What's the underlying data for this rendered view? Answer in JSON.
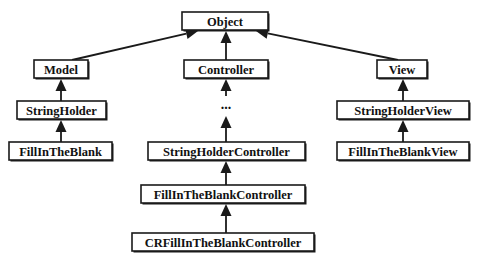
{
  "diagram": {
    "type": "class-inheritance-hierarchy",
    "nodes": [
      {
        "id": "object",
        "label": "Object"
      },
      {
        "id": "model",
        "label": "Model"
      },
      {
        "id": "controller",
        "label": "Controller"
      },
      {
        "id": "view",
        "label": "View"
      },
      {
        "id": "stringholder",
        "label": "StringHolder"
      },
      {
        "id": "fillintheblank",
        "label": "FillInTheBlank"
      },
      {
        "id": "ellipsis",
        "label": "..."
      },
      {
        "id": "stringholdercontroller",
        "label": "StringHolderController"
      },
      {
        "id": "fillintheblankcontroller",
        "label": "FillInTheBlankController"
      },
      {
        "id": "crfillintheblankcontroller",
        "label": "CRFillInTheBlankController"
      },
      {
        "id": "stringholderview",
        "label": "StringHolderView"
      },
      {
        "id": "fillintheblankview",
        "label": "FillInTheBlankView"
      }
    ],
    "edges": [
      {
        "from": "model",
        "to": "object",
        "relation": "inherits"
      },
      {
        "from": "controller",
        "to": "object",
        "relation": "inherits"
      },
      {
        "from": "view",
        "to": "object",
        "relation": "inherits"
      },
      {
        "from": "stringholder",
        "to": "model",
        "relation": "inherits"
      },
      {
        "from": "fillintheblank",
        "to": "stringholder",
        "relation": "inherits"
      },
      {
        "from": "ellipsis",
        "to": "controller",
        "relation": "inherits"
      },
      {
        "from": "stringholdercontroller",
        "to": "ellipsis",
        "relation": "inherits"
      },
      {
        "from": "fillintheblankcontroller",
        "to": "stringholdercontroller",
        "relation": "inherits"
      },
      {
        "from": "crfillintheblankcontroller",
        "to": "fillintheblankcontroller",
        "relation": "inherits"
      },
      {
        "from": "stringholderview",
        "to": "view",
        "relation": "inherits"
      },
      {
        "from": "fillintheblankview",
        "to": "stringholderview",
        "relation": "inherits"
      }
    ]
  }
}
